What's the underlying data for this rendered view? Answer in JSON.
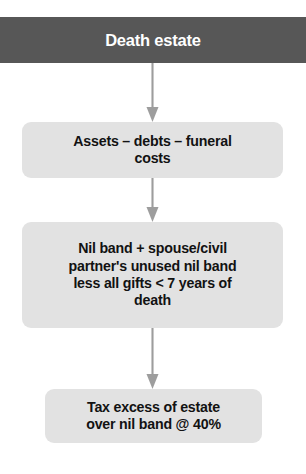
{
  "diagram": {
    "colors": {
      "header_fill": "#575757",
      "header_text": "#ffffff",
      "box_fill": "#e2e2e2",
      "box_text": "#121212",
      "arrow": "#9d9d9d",
      "background": "#ffffff"
    },
    "nodes": [
      {
        "id": "death-estate",
        "label": "Death estate",
        "type": "header",
        "step": 1
      },
      {
        "id": "assets-debts-funeral",
        "label": "Assets – debts – funeral\ncosts",
        "type": "process",
        "step": 2
      },
      {
        "id": "nil-band",
        "label": "Nil band + spouse/civil\npartner's unused nil band\nless all gifts < 7 years of\ndeath",
        "type": "process",
        "step": 3
      },
      {
        "id": "tax-excess",
        "label": "Tax excess of estate\nover nil band @ 40%",
        "type": "process",
        "step": 4
      }
    ],
    "connectors": [
      {
        "id": "connector-1",
        "from": "death-estate",
        "to": "assets-debts-funeral",
        "style": "down-arrow"
      },
      {
        "id": "connector-2",
        "from": "assets-debts-funeral",
        "to": "nil-band",
        "style": "down-arrow"
      },
      {
        "id": "connector-3",
        "from": "nil-band",
        "to": "tax-excess",
        "style": "down-arrow"
      }
    ]
  }
}
